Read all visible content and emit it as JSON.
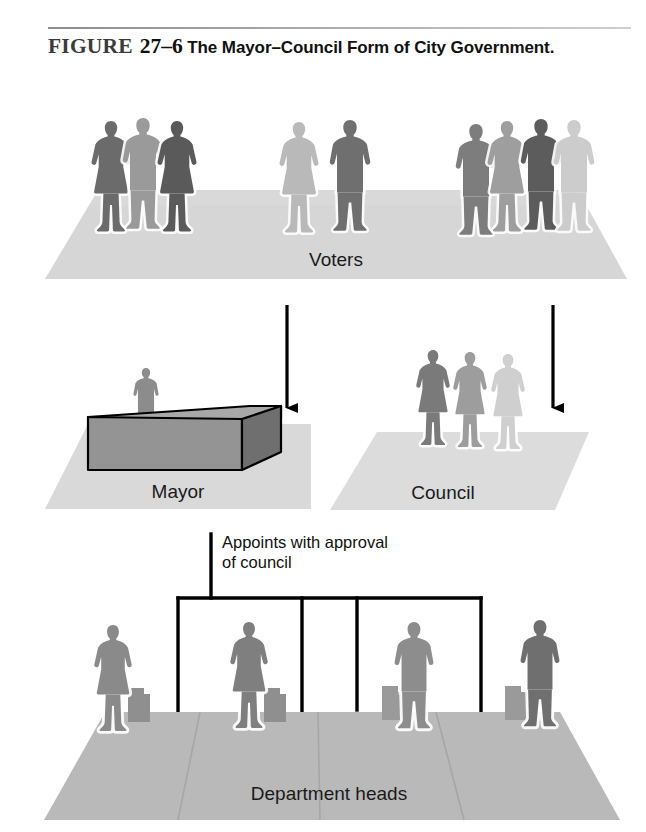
{
  "caption": {
    "figure_word": "FIGURE",
    "figure_number": "27–6",
    "title": "The Mayor–Council Form of City Government."
  },
  "diagram": {
    "type": "organizational-flow",
    "tiers": [
      {
        "id": "voters",
        "label": "Voters",
        "figure_count": 9,
        "platform_color": "#d6d6d6",
        "people": [
          {
            "sex": "female",
            "shade": "#6b6b6b"
          },
          {
            "sex": "male",
            "shade": "#9a9a9a"
          },
          {
            "sex": "female",
            "shade": "#5a5a5a"
          },
          {
            "sex": "female",
            "shade": "#b9b9b9"
          },
          {
            "sex": "male",
            "shade": "#7d7d7d"
          },
          {
            "sex": "male",
            "shade": "#8a8a8a"
          },
          {
            "sex": "female",
            "shade": "#9e9e9e"
          },
          {
            "sex": "male",
            "shade": "#5c5c5c"
          },
          {
            "sex": "male",
            "shade": "#cccccc"
          }
        ]
      },
      {
        "id": "mayor",
        "label": "Mayor",
        "figure_count": 1,
        "platform_color": "#d9d9d9",
        "desk_top_color": "#a8a8a8",
        "desk_front_color": "#949494",
        "people": [
          {
            "sex": "male",
            "shade": "#8c8c8c"
          }
        ]
      },
      {
        "id": "council",
        "label": "Council",
        "figure_count": 3,
        "platform_color": "#dcdcdc",
        "people": [
          {
            "sex": "female",
            "shade": "#7a7a7a"
          },
          {
            "sex": "female",
            "shade": "#9d9d9d"
          },
          {
            "sex": "female",
            "shade": "#cfcfcf"
          }
        ]
      },
      {
        "id": "department-heads",
        "label": "Department heads",
        "figure_count": 4,
        "platform_color": "#b9b9b9",
        "people": [
          {
            "sex": "female",
            "shade": "#8a8a8a"
          },
          {
            "sex": "female",
            "shade": "#7f7f7f"
          },
          {
            "sex": "male",
            "shade": "#8d8d8d"
          },
          {
            "sex": "male",
            "shade": "#6f6f6f"
          }
        ]
      }
    ],
    "annotations": {
      "appoints_note": "Appoints with approval\nof council"
    },
    "arrows": [
      {
        "id": "voters-to-mayor",
        "direction": "down"
      },
      {
        "id": "voters-to-council",
        "direction": "down"
      }
    ],
    "connector": {
      "id": "mayor-to-department-heads",
      "branch_count": 4,
      "line_color": "#000000"
    }
  }
}
